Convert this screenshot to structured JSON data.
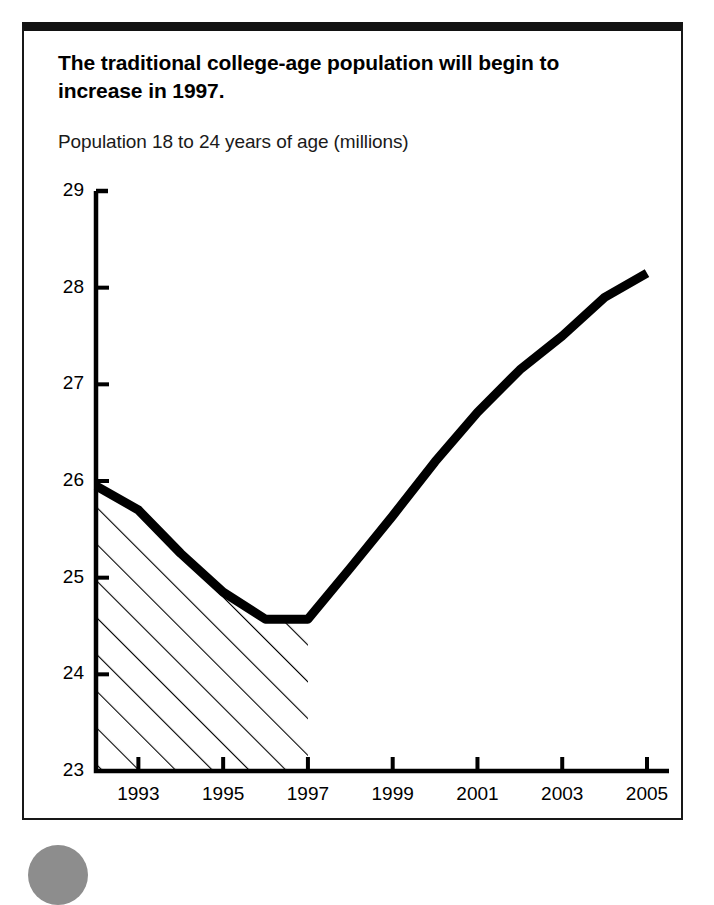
{
  "figure": {
    "title": "The traditional college-age population will begin to increase in 1997.",
    "subtitle": "Population 18 to 24 years of age (millions)"
  },
  "chart_data": {
    "type": "line",
    "title": "The traditional college-age population will begin to increase in 1997.",
    "subtitle": "Population 18 to 24 years of age (millions)",
    "xlabel": "",
    "ylabel": "Population 18 to 24 years of age (millions)",
    "x": [
      1992,
      1993,
      1994,
      1995,
      1996,
      1997,
      1998,
      1999,
      2000,
      2001,
      2002,
      2003,
      2004,
      2005
    ],
    "values": [
      25.95,
      25.7,
      25.25,
      24.85,
      24.57,
      24.57,
      25.1,
      25.64,
      26.2,
      26.71,
      27.15,
      27.5,
      27.9,
      28.15
    ],
    "series": [
      {
        "name": "Population 18 to 24 years of age (millions)",
        "values": [
          25.95,
          25.7,
          25.25,
          24.85,
          24.57,
          24.57,
          25.1,
          25.64,
          26.2,
          26.71,
          27.15,
          27.5,
          27.9,
          28.15
        ]
      }
    ],
    "xlim": [
      1992,
      2005
    ],
    "ylim": [
      23,
      29
    ],
    "y_ticks": [
      23,
      24,
      25,
      26,
      27,
      28,
      29
    ],
    "y_tick_labels": [
      "23",
      "24",
      "25",
      "26",
      "27",
      "28",
      "29"
    ],
    "x_ticks": [
      1993,
      1995,
      1997,
      1999,
      2001,
      2003,
      2005
    ],
    "x_tick_labels": [
      "1993",
      "1995",
      "1997",
      "1999",
      "2001",
      "2003",
      "2005"
    ],
    "grid": false,
    "legend": "none",
    "line_color": "#000000",
    "line_width_px": 9,
    "shaded_region": {
      "label": "",
      "pattern": "diagonal-hatch",
      "x_start": 1992,
      "x_end": 1997
    }
  }
}
